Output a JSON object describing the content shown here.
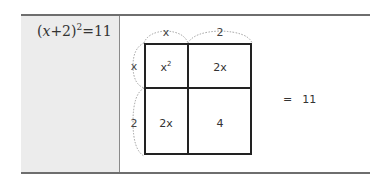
{
  "equation": {
    "base_open": "(",
    "variable": "x",
    "plus": "+2)",
    "exponent": "2",
    "equals": "=11"
  },
  "diagram": {
    "top_dims": [
      "x",
      "2"
    ],
    "left_dims": [
      "x",
      "2"
    ],
    "cells": {
      "top_left_base": "x",
      "top_left_exp": "2",
      "top_right": "2x",
      "bottom_left": "2x",
      "bottom_right": "4"
    }
  },
  "result": {
    "equals_sign": "=",
    "value": "11"
  }
}
